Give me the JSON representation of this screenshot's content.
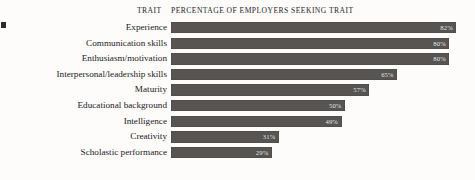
{
  "header": {
    "trait_column": "TRAIT",
    "percentage_column": "PERCENTAGE OF EMPLOYERS SEEKING TRAIT"
  },
  "colors": {
    "bar": "#575452",
    "background": "#fdfcfb",
    "text": "#23201d",
    "value_label": "#f4f3f1"
  },
  "chart_data": {
    "type": "bar",
    "orientation": "horizontal",
    "title": "PERCENTAGE OF EMPLOYERS SEEKING TRAIT",
    "xlabel": "",
    "ylabel": "TRAIT",
    "xlim": [
      0,
      82
    ],
    "grid": false,
    "legend": false,
    "axis_visible": false,
    "value_suffix": "%",
    "categories": [
      "Experience",
      "Communication skills",
      "Enthusiasm/motivation",
      "Interpersonal/leadership skills",
      "Maturity",
      "Educational background",
      "Intelligence",
      "Creativity",
      "Scholastic performance"
    ],
    "values": [
      82,
      80,
      80,
      65,
      57,
      50,
      49,
      31,
      29
    ],
    "value_labels": [
      "82%",
      "80%",
      "80%",
      "65%",
      "57%",
      "50%",
      "49%",
      "31%",
      "29%"
    ],
    "rows": [
      {
        "label": "Experience",
        "value": 82,
        "value_label": "82%"
      },
      {
        "label": "Communication skills",
        "value": 80,
        "value_label": "80%"
      },
      {
        "label": "Enthusiasm/motivation",
        "value": 80,
        "value_label": "80%"
      },
      {
        "label": "Interpersonal/leadership skills",
        "value": 65,
        "value_label": "65%"
      },
      {
        "label": "Maturity",
        "value": 57,
        "value_label": "57%"
      },
      {
        "label": "Educational background",
        "value": 50,
        "value_label": "50%"
      },
      {
        "label": "Intelligence",
        "value": 49,
        "value_label": "49%"
      },
      {
        "label": "Creativity",
        "value": 31,
        "value_label": "31%"
      },
      {
        "label": "Scholastic performance",
        "value": 29,
        "value_label": "29%"
      }
    ]
  },
  "scale": {
    "pixels_per_percent": 3.48
  }
}
